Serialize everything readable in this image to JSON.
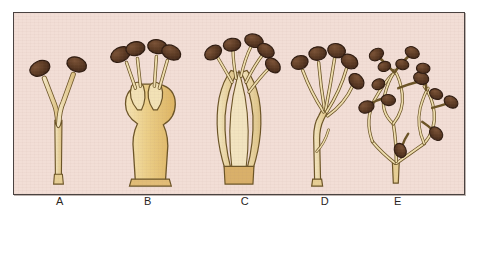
{
  "plate": {
    "background_color": "#f2ded6",
    "border_color": "#4a4240",
    "page_color": "#ffffff"
  },
  "palette": {
    "sporangium_fill": "#5a3a24",
    "sporangium_fill_light": "#6b4630",
    "sporangium_outline": "#2e1b10",
    "stalk_fill": "#ead6a4",
    "stalk_fill_deep": "#e3bf72",
    "stalk_fill_pale": "#f0e2bd",
    "stalk_outline": "#6b5426",
    "base_fill": "#d9b06a"
  },
  "figures": [
    {
      "id": "A",
      "label": "A",
      "label_x": 47,
      "description": "simple forked sporophore with two terminal sporangia",
      "sporangia_count": 2,
      "branch_order": 1
    },
    {
      "id": "B",
      "label": "B",
      "label_x": 135,
      "description": "swollen bulbous vesicle bearing four short-stalked sporangia",
      "sporangia_count": 4,
      "branch_order": 2
    },
    {
      "id": "C",
      "label": "C",
      "label_x": 232,
      "description": "elongated sheathing base with long parallel filaments and terminal sporangia",
      "sporangia_count": 5,
      "branch_order": 2
    },
    {
      "id": "D",
      "label": "D",
      "label_x": 312,
      "description": "single stalk branching into a spray of filaments each tipped with a sporangium",
      "sporangia_count": 5,
      "branch_order": 3
    },
    {
      "id": "E",
      "label": "E",
      "label_x": 385,
      "description": "highly branched anastomosing network with numerous lateral sporangia",
      "sporangia_count": 13,
      "branch_order": 4
    }
  ]
}
